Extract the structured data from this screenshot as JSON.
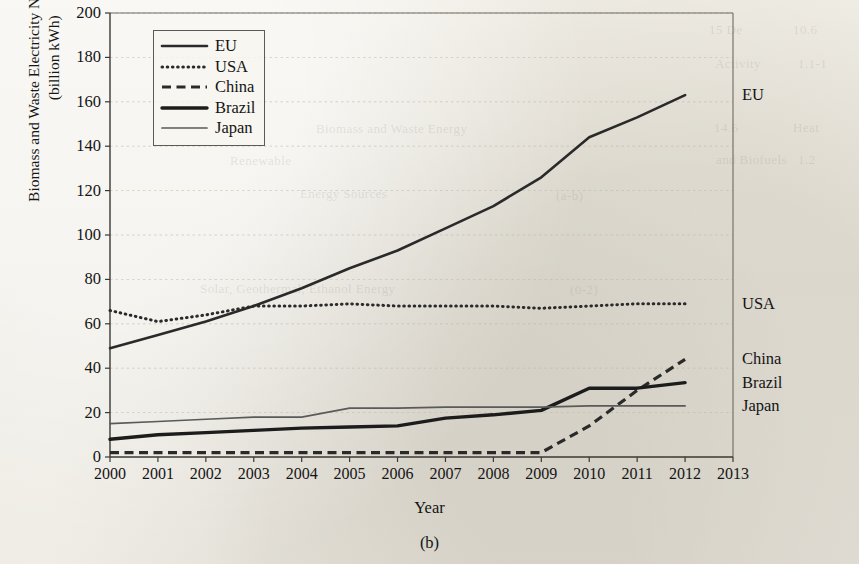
{
  "figure": {
    "caption": "(b)",
    "xaxis_title": "Year",
    "yaxis_title_line1": "Biomass and Waste Electricity Net Generation",
    "yaxis_title_line2": "(billion kWh)"
  },
  "legend": {
    "items": [
      {
        "label": "EU",
        "style": "solid-medium"
      },
      {
        "label": "USA",
        "style": "dotted"
      },
      {
        "label": "China",
        "style": "dashed"
      },
      {
        "label": "Brazil",
        "style": "solid-thick"
      },
      {
        "label": "Japan",
        "style": "solid-thin"
      }
    ]
  },
  "end_labels": [
    {
      "label": "EU",
      "value": 163
    },
    {
      "label": "USA",
      "value": 69
    },
    {
      "label": "China",
      "value": 44
    },
    {
      "label": "Brazil",
      "value": 33.5
    },
    {
      "label": "Japan",
      "value": 23
    }
  ],
  "chart_data": {
    "type": "line",
    "title": "",
    "subtitle": "",
    "xlabel": "Year",
    "ylabel": "Biomass and Waste Electricity Net Generation (billion kWh)",
    "grid": true,
    "grid_axis": "y",
    "legend_position": "top-left-inside",
    "xlim": [
      2000,
      2013
    ],
    "ylim": [
      0,
      200
    ],
    "ytick_step": 20,
    "yticks": [
      0,
      20,
      40,
      60,
      80,
      100,
      120,
      140,
      160,
      180,
      200
    ],
    "xticks": [
      2000,
      2001,
      2002,
      2003,
      2004,
      2005,
      2006,
      2007,
      2008,
      2009,
      2010,
      2011,
      2012,
      2013
    ],
    "categories": [
      2000,
      2001,
      2002,
      2003,
      2004,
      2005,
      2006,
      2007,
      2008,
      2009,
      2010,
      2011,
      2012
    ],
    "series": [
      {
        "name": "EU",
        "style": "solid-medium",
        "color": "#2a2a2a",
        "values": [
          49,
          55,
          61,
          68,
          76,
          85,
          93,
          103,
          113,
          126,
          144,
          153,
          163
        ]
      },
      {
        "name": "USA",
        "style": "dotted",
        "color": "#2a2a2a",
        "values": [
          66,
          61,
          64,
          68,
          68,
          69,
          68,
          68,
          68,
          67,
          68,
          69,
          69
        ]
      },
      {
        "name": "China",
        "style": "dashed",
        "color": "#2a2a2a",
        "values": [
          2,
          2,
          2,
          2,
          2,
          2,
          2,
          2,
          2,
          2,
          14,
          30,
          44
        ]
      },
      {
        "name": "Brazil",
        "style": "solid-thick",
        "color": "#1c1c1c",
        "values": [
          8,
          10,
          11,
          12,
          13,
          13.5,
          14,
          17.5,
          19,
          21,
          31,
          31,
          33.5
        ]
      },
      {
        "name": "Japan",
        "style": "solid-thin",
        "color": "#5a5a5a",
        "values": [
          15,
          16,
          17,
          18,
          18,
          22,
          22,
          22.5,
          22.5,
          22.5,
          23,
          23,
          23
        ]
      }
    ]
  },
  "bleed_through": [
    {
      "text": "15 De",
      "x": 709,
      "y": 22
    },
    {
      "text": "10.6",
      "x": 793,
      "y": 22
    },
    {
      "text": "Activity",
      "x": 715,
      "y": 56
    },
    {
      "text": "1.1-1",
      "x": 798,
      "y": 56
    },
    {
      "text": "14.6",
      "x": 714,
      "y": 120
    },
    {
      "text": "Heat",
      "x": 793,
      "y": 120
    },
    {
      "text": "Biomass and Waste Energy",
      "x": 316,
      "y": 121
    },
    {
      "text": "and Biofuels",
      "x": 716,
      "y": 152
    },
    {
      "text": "(a-b)",
      "x": 556,
      "y": 188
    },
    {
      "text": "1.2",
      "x": 798,
      "y": 152
    },
    {
      "text": "Renewable",
      "x": 230,
      "y": 153
    },
    {
      "text": "Energy Sources",
      "x": 300,
      "y": 186
    },
    {
      "text": "Solar, Geothermal, Ethanol Energy",
      "x": 200,
      "y": 281
    },
    {
      "text": "(0-2)",
      "x": 570,
      "y": 282
    }
  ]
}
